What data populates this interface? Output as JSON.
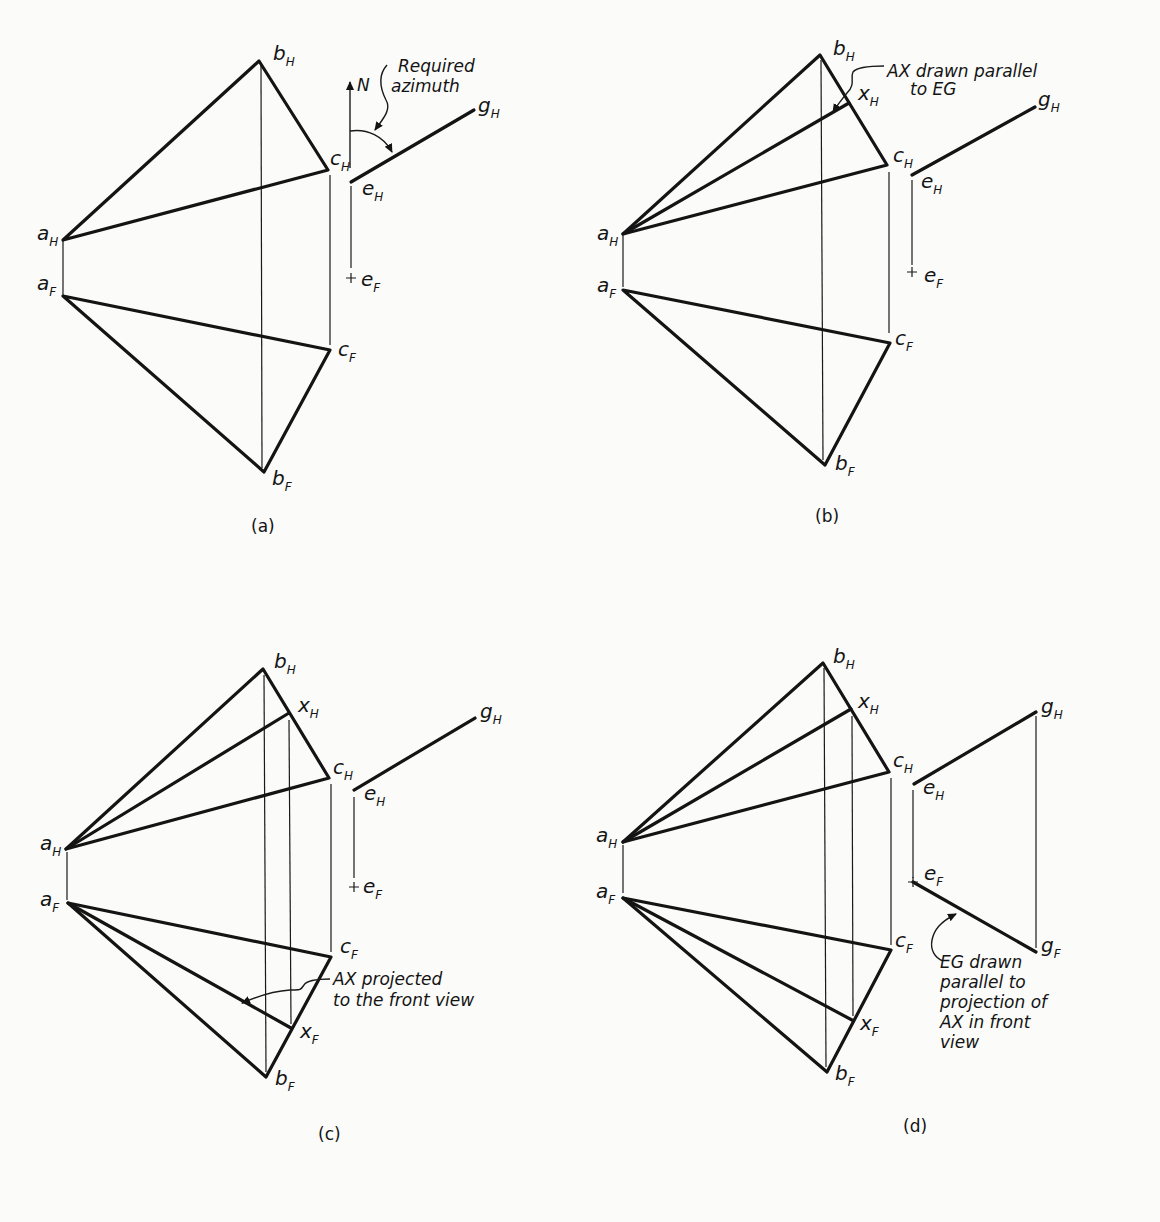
{
  "panels": [
    {
      "id": "a",
      "caption": "(a)",
      "points": {
        "a_H": [
          63,
          240
        ],
        "b_H": [
          259,
          61
        ],
        "c_H": [
          328,
          170
        ],
        "a_F": [
          63,
          296
        ],
        "b_F": [
          264,
          472
        ],
        "c_F": [
          330,
          350
        ],
        "e_H": [
          351,
          182
        ],
        "g_H": [
          474,
          110
        ],
        "e_F": [
          351,
          278
        ]
      },
      "labels": {
        "a_H": {
          "main": "a",
          "sub": "H"
        },
        "b_H": {
          "main": "b",
          "sub": "H"
        },
        "c_H": {
          "main": "c",
          "sub": "H"
        },
        "a_F": {
          "main": "a",
          "sub": "F"
        },
        "b_F": {
          "main": "b",
          "sub": "F"
        },
        "c_F": {
          "main": "c",
          "sub": "F"
        },
        "e_H": {
          "main": "e",
          "sub": "H"
        },
        "g_H": {
          "main": "g",
          "sub": "H"
        },
        "e_F": {
          "main": "e",
          "sub": "F"
        },
        "north": "N"
      },
      "annotations": [
        {
          "lines": [
            "Required",
            "azimuth"
          ]
        }
      ]
    },
    {
      "id": "b",
      "caption": "(b)",
      "points": {
        "a_H": [
          623,
          234
        ],
        "b_H": [
          820,
          55
        ],
        "c_H": [
          887,
          165
        ],
        "x_H": [
          849,
          103
        ],
        "a_F": [
          623,
          290
        ],
        "b_F": [
          825,
          465
        ],
        "c_F": [
          890,
          343
        ],
        "e_H": [
          912,
          175
        ],
        "g_H": [
          1035,
          107
        ],
        "e_F": [
          912,
          272
        ]
      },
      "labels": {
        "a_H": {
          "main": "a",
          "sub": "H"
        },
        "b_H": {
          "main": "b",
          "sub": "H"
        },
        "c_H": {
          "main": "c",
          "sub": "H"
        },
        "x_H": {
          "main": "x",
          "sub": "H"
        },
        "a_F": {
          "main": "a",
          "sub": "F"
        },
        "b_F": {
          "main": "b",
          "sub": "F"
        },
        "c_F": {
          "main": "c",
          "sub": "F"
        },
        "e_H": {
          "main": "e",
          "sub": "H"
        },
        "g_H": {
          "main": "g",
          "sub": "H"
        },
        "e_F": {
          "main": "e",
          "sub": "F"
        }
      },
      "annotations": [
        {
          "lines": [
            "AX drawn parallel",
            "to EG"
          ]
        }
      ]
    },
    {
      "id": "c",
      "caption": "(c)",
      "points": {
        "a_H": [
          66,
          849
        ],
        "b_H": [
          263,
          669
        ],
        "c_H": [
          329,
          778
        ],
        "x_H": [
          289,
          713
        ],
        "a_F": [
          68,
          903
        ],
        "b_F": [
          266,
          1077
        ],
        "c_F": [
          331,
          957
        ],
        "x_F": [
          291,
          1028
        ],
        "e_H": [
          354,
          790
        ],
        "g_H": [
          475,
          718
        ],
        "e_F": [
          354,
          887
        ]
      },
      "labels": {
        "a_H": {
          "main": "a",
          "sub": "H"
        },
        "b_H": {
          "main": "b",
          "sub": "H"
        },
        "c_H": {
          "main": "c",
          "sub": "H"
        },
        "x_H": {
          "main": "x",
          "sub": "H"
        },
        "a_F": {
          "main": "a",
          "sub": "F"
        },
        "b_F": {
          "main": "b",
          "sub": "F"
        },
        "c_F": {
          "main": "c",
          "sub": "F"
        },
        "x_F": {
          "main": "x",
          "sub": "F"
        },
        "e_H": {
          "main": "e",
          "sub": "H"
        },
        "g_H": {
          "main": "g",
          "sub": "H"
        },
        "e_F": {
          "main": "e",
          "sub": "F"
        }
      },
      "annotations": [
        {
          "lines": [
            "AX projected",
            "to the front view"
          ]
        }
      ]
    },
    {
      "id": "d",
      "caption": "(d)",
      "points": {
        "a_H": [
          623,
          842
        ],
        "b_H": [
          823,
          663
        ],
        "c_H": [
          889,
          772
        ],
        "x_H": [
          851,
          709
        ],
        "a_F": [
          623,
          898
        ],
        "b_F": [
          827,
          1072
        ],
        "c_F": [
          891,
          950
        ],
        "x_F": [
          852,
          1020
        ],
        "e_H": [
          914,
          784
        ],
        "g_H": [
          1036,
          712
        ],
        "e_F": [
          913,
          882
        ],
        "g_F": [
          1036,
          952
        ]
      },
      "labels": {
        "a_H": {
          "main": "a",
          "sub": "H"
        },
        "b_H": {
          "main": "b",
          "sub": "H"
        },
        "c_H": {
          "main": "c",
          "sub": "H"
        },
        "x_H": {
          "main": "x",
          "sub": "H"
        },
        "a_F": {
          "main": "a",
          "sub": "F"
        },
        "b_F": {
          "main": "b",
          "sub": "F"
        },
        "c_F": {
          "main": "c",
          "sub": "F"
        },
        "x_F": {
          "main": "x",
          "sub": "F"
        },
        "e_H": {
          "main": "e",
          "sub": "H"
        },
        "g_H": {
          "main": "g",
          "sub": "H"
        },
        "e_F": {
          "main": "e",
          "sub": "F"
        },
        "g_F": {
          "main": "g",
          "sub": "F"
        }
      },
      "annotations": [
        {
          "lines": [
            "EG drawn",
            "parallel to",
            "projection of",
            "AX in front",
            "view"
          ]
        }
      ]
    }
  ]
}
